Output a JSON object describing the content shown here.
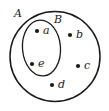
{
  "diagram": {
    "type": "euler-diagram",
    "title": "",
    "background_color": "#ffffff",
    "stroke_color": "#1a1a1a",
    "sets": [
      {
        "id": "A",
        "label": "A",
        "shape": "circle",
        "label_x": 18,
        "label_y": 14,
        "cx": 55,
        "cy": 56.5,
        "rx": 45,
        "ry": 45,
        "rotation": 0,
        "stroke_width": 1.5,
        "contains": [
          "a",
          "b",
          "c",
          "d",
          "e"
        ]
      },
      {
        "id": "B",
        "label": "B",
        "shape": "ellipse",
        "label_x": 58,
        "label_y": 20,
        "cx": 41.5,
        "cy": 48,
        "rx": 19,
        "ry": 28,
        "rotation": -4,
        "stroke_width": 1.3,
        "contains": [
          "a",
          "e"
        ]
      }
    ],
    "points": [
      {
        "id": "a",
        "label": "a",
        "dot_x": 37,
        "dot_y": 31,
        "label_x": 43,
        "label_y": 31,
        "dot_r": 2.1,
        "member_of": [
          "A",
          "B"
        ]
      },
      {
        "id": "b",
        "label": "b",
        "dot_x": 70,
        "dot_y": 35,
        "label_x": 76,
        "label_y": 35,
        "dot_r": 2.1,
        "member_of": [
          "A"
        ]
      },
      {
        "id": "c",
        "label": "c",
        "dot_x": 78,
        "dot_y": 66,
        "label_x": 84,
        "label_y": 66,
        "dot_r": 2.1,
        "member_of": [
          "A"
        ]
      },
      {
        "id": "d",
        "label": "d",
        "dot_x": 52,
        "dot_y": 85,
        "label_x": 58,
        "label_y": 85,
        "dot_r": 2.1,
        "member_of": [
          "A"
        ]
      },
      {
        "id": "e",
        "label": "e",
        "dot_x": 32,
        "dot_y": 64,
        "label_x": 38,
        "label_y": 64,
        "dot_r": 2.1,
        "member_of": [
          "A",
          "B"
        ]
      }
    ]
  }
}
